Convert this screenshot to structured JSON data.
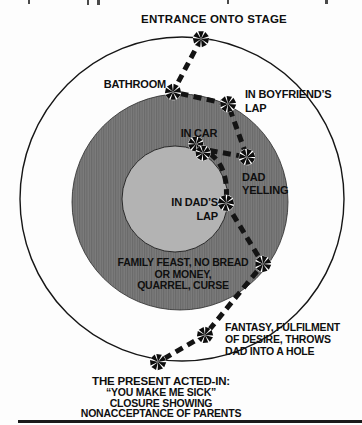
{
  "figure_type": "psychodrama-spiral-diagram",
  "labels": {
    "entrance": {
      "lines": [
        "ENTRANCE ONTO STAGE"
      ]
    },
    "bathroom": {
      "lines": [
        "BATHROOM"
      ]
    },
    "boyfriends_lap": {
      "lines": [
        "IN BOYFRIEND’S",
        "LAP"
      ]
    },
    "in_car": {
      "lines": [
        "IN CAR"
      ]
    },
    "dad_yelling": {
      "lines": [
        "DAD",
        "YELLING"
      ]
    },
    "in_dads_lap": {
      "lines": [
        "IN DAD’S",
        "LAP"
      ]
    },
    "family_feast": {
      "lines": [
        "FAMILY FEAST, NO BREAD",
        "OR MONEY,",
        "QUARREL, CURSE"
      ]
    },
    "fantasy": {
      "lines": [
        "FANTASY, FULFILMENT",
        "OF DESIRE, THROWS",
        "DAD INTO A HOLE"
      ]
    },
    "present": {
      "lines": [
        "THE PRESENT ACTED-IN:",
        "“YOU MAKE ME SICK”",
        "CLOSURE SHOWING",
        "NONACCEPTANCE OF PARENTS"
      ]
    }
  },
  "stations_in_path_order": [
    "ENTRANCE ONTO STAGE",
    "BATHROOM",
    "IN BOYFRIEND’S LAP",
    "DAD YELLING",
    "IN CAR",
    "IN DAD’S LAP",
    "FAMILY FEAST, NO BREAD OR MONEY, QUARREL, CURSE",
    "FANTASY, FULFILMENT OF DESIRE, THROWS DAD INTO A HOLE",
    "THE PRESENT ACTED-IN: “YOU MAKE ME SICK” CLOSURE SHOWING NONACCEPTANCE OF PARENTS"
  ],
  "colors": {
    "background": "#fdfdfd",
    "outer_circle_fill": "#fdfdfd",
    "middle_ring_fill": "#737373",
    "inner_circle_fill": "#b3b3b3",
    "outline": "#161616",
    "path_dash": "#141414",
    "text": "#0f0f0f",
    "node_fill": "#0d0d0d",
    "node_halo": "#ffffff"
  }
}
